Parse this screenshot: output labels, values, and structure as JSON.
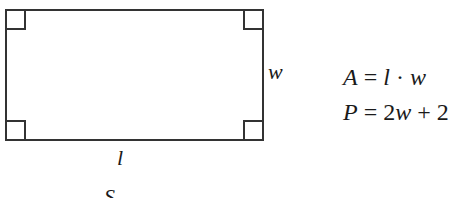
{
  "diagram": {
    "shape": "rectangle",
    "right_angle_markers": 4,
    "side_labels": {
      "width": "w",
      "length": "l"
    },
    "caption_partial": "S"
  },
  "formulas": [
    {
      "lhs": "A",
      "eq": " = ",
      "rhs_parts": [
        "l",
        " · ",
        "w"
      ]
    },
    {
      "lhs": "P",
      "eq": " = ",
      "rhs_parts": [
        "2",
        "w",
        " + 2"
      ]
    }
  ],
  "colors": {
    "stroke": "#333333",
    "text": "#1a1a1a",
    "background": "#ffffff"
  }
}
